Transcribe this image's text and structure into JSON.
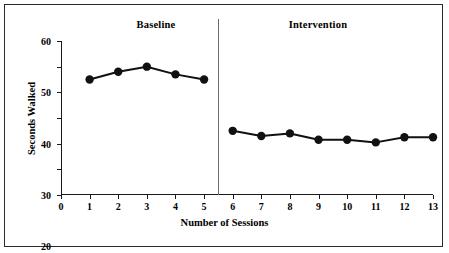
{
  "figure": {
    "border_color": "#2b2b2b",
    "background": "#ffffff"
  },
  "phases": {
    "baseline_label": "Baseline",
    "intervention_label": "Intervention"
  },
  "axes": {
    "y_title": "Seconds Walked",
    "x_title": "Number of Sessions",
    "y_ticks": [
      0,
      10,
      20,
      30,
      40,
      50,
      60
    ],
    "x_ticks": [
      0,
      1,
      2,
      3,
      4,
      5,
      6,
      7,
      8,
      9,
      10,
      11,
      12,
      13
    ]
  },
  "chart_data": {
    "type": "line",
    "title": "",
    "subtitle": "",
    "xlabel": "Number of Sessions",
    "ylabel": "Seconds Walked",
    "xlim": [
      0,
      13
    ],
    "ylim": [
      0,
      60
    ],
    "grid": false,
    "legend": false,
    "marker": "filled-circle",
    "marker_color": "#111111",
    "line_color": "#111111",
    "x": [
      1,
      2,
      3,
      4,
      5,
      6,
      7,
      8,
      9,
      10,
      11,
      12,
      13
    ],
    "series": [
      {
        "name": "Baseline",
        "x": [
          1,
          2,
          3,
          4,
          5
        ],
        "values": [
          45,
          48,
          50,
          47,
          45
        ]
      },
      {
        "name": "Intervention",
        "x": [
          6,
          7,
          8,
          9,
          10,
          11,
          12,
          13
        ],
        "values": [
          25,
          23,
          24,
          21.5,
          21.5,
          20.5,
          22.5,
          22.5
        ]
      }
    ],
    "annotations": [
      {
        "text": "Baseline",
        "type": "phase-label",
        "x_range": [
          0,
          5.5
        ]
      },
      {
        "text": "Intervention",
        "type": "phase-label",
        "x_range": [
          5.5,
          13
        ]
      },
      {
        "text": "",
        "type": "phase-change-line",
        "x": 5.5
      }
    ]
  }
}
